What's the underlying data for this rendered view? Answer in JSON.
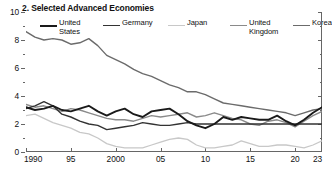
{
  "chart_data": {
    "type": "line",
    "title": "2. Selected Advanced Economies",
    "xlabel": "",
    "ylabel": "",
    "xlim": [
      1990,
      2023
    ],
    "ylim": [
      0,
      10
    ],
    "yticks": [
      0,
      2,
      4,
      6,
      8,
      10
    ],
    "ytick_labels": [
      "0",
      "2",
      "4",
      "6",
      "8",
      "10"
    ],
    "yminor": [
      1,
      3,
      5,
      7,
      9
    ],
    "xticks": [
      1990,
      1995,
      2000,
      2005,
      2010,
      2015,
      2020,
      2023
    ],
    "xtick_labels": [
      "1990",
      "95",
      "2000",
      "05",
      "10",
      "15",
      "20",
      "23"
    ],
    "grid": false,
    "legend_position": "top",
    "x": [
      1990,
      1991,
      1992,
      1993,
      1994,
      1995,
      1996,
      1997,
      1998,
      1999,
      2000,
      2001,
      2002,
      2003,
      2004,
      2005,
      2006,
      2007,
      2008,
      2009,
      2010,
      2011,
      2012,
      2013,
      2014,
      2015,
      2016,
      2017,
      2018,
      2019,
      2020,
      2021,
      2022,
      2023
    ],
    "series": [
      {
        "name": "United States",
        "color": "#1a1a1a",
        "width": 1.9,
        "values": [
          3.2,
          3.0,
          3.1,
          3.3,
          3.0,
          2.9,
          3.1,
          3.3,
          2.9,
          2.6,
          2.9,
          3.1,
          2.7,
          2.5,
          2.9,
          3.0,
          3.1,
          2.7,
          2.2,
          1.9,
          1.7,
          2.0,
          2.5,
          2.3,
          2.5,
          2.4,
          2.3,
          2.3,
          2.6,
          2.2,
          1.9,
          2.3,
          2.8,
          3.2
        ]
      },
      {
        "name": "Germany",
        "color": "#333333",
        "width": 1.4,
        "values": [
          3.1,
          3.3,
          3.6,
          3.3,
          2.7,
          2.5,
          2.2,
          2.0,
          1.9,
          1.6,
          1.7,
          1.8,
          1.9,
          2.1,
          2.0,
          1.9,
          1.9,
          2.0,
          2.1,
          2.0,
          2.0,
          2.0,
          2.0,
          2.0,
          2.0,
          2.0,
          2.0,
          2.0,
          2.0,
          2.0,
          2.0,
          2.0,
          2.0,
          2.0
        ]
      },
      {
        "name": "Japan",
        "color": "#c8c8c8",
        "width": 1.3,
        "values": [
          2.6,
          2.7,
          2.4,
          2.1,
          1.9,
          1.7,
          1.4,
          1.3,
          1.0,
          0.6,
          0.4,
          0.3,
          0.3,
          0.3,
          0.5,
          0.7,
          0.9,
          1.0,
          0.9,
          0.5,
          0.3,
          0.3,
          0.4,
          0.5,
          0.8,
          0.6,
          0.4,
          0.4,
          0.5,
          0.5,
          0.4,
          0.3,
          0.5,
          0.8
        ]
      },
      {
        "name": "United Kingdom",
        "color": "#8a8a8a",
        "width": 1.4,
        "values": [
          3.4,
          3.2,
          3.3,
          3.1,
          2.9,
          3.1,
          3.0,
          2.8,
          2.6,
          2.4,
          2.3,
          2.3,
          2.2,
          2.4,
          2.6,
          2.5,
          2.6,
          2.7,
          2.8,
          2.5,
          2.6,
          2.8,
          2.6,
          2.4,
          2.3,
          2.0,
          1.9,
          2.2,
          2.3,
          2.1,
          1.8,
          2.2,
          2.6,
          2.9
        ]
      },
      {
        "name": "Korea",
        "color": "#6b6b6b",
        "width": 1.4,
        "values": [
          8.6,
          8.2,
          8.0,
          8.1,
          8.0,
          7.7,
          7.8,
          8.1,
          7.6,
          6.9,
          6.6,
          6.3,
          5.9,
          5.6,
          5.4,
          5.1,
          4.8,
          4.6,
          4.3,
          4.3,
          4.1,
          3.8,
          3.5,
          3.4,
          3.3,
          3.2,
          3.1,
          3.0,
          2.9,
          2.8,
          2.6,
          2.8,
          3.0,
          3.1
        ]
      }
    ]
  },
  "chart": {
    "title": "2. Selected Advanced Economies",
    "legend": [
      {
        "label": "United\nStates",
        "color": "#1a1a1a",
        "width": 2.4
      },
      {
        "label": "Germany",
        "color": "#333333",
        "width": 1.8
      },
      {
        "label": "Japan",
        "color": "#c8c8c8",
        "width": 1.6
      },
      {
        "label": "United\nKingdom",
        "color": "#8a8a8a",
        "width": 1.8
      },
      {
        "label": "Korea",
        "color": "#6b6b6b",
        "width": 1.8
      }
    ],
    "axis_color": "#666666"
  }
}
